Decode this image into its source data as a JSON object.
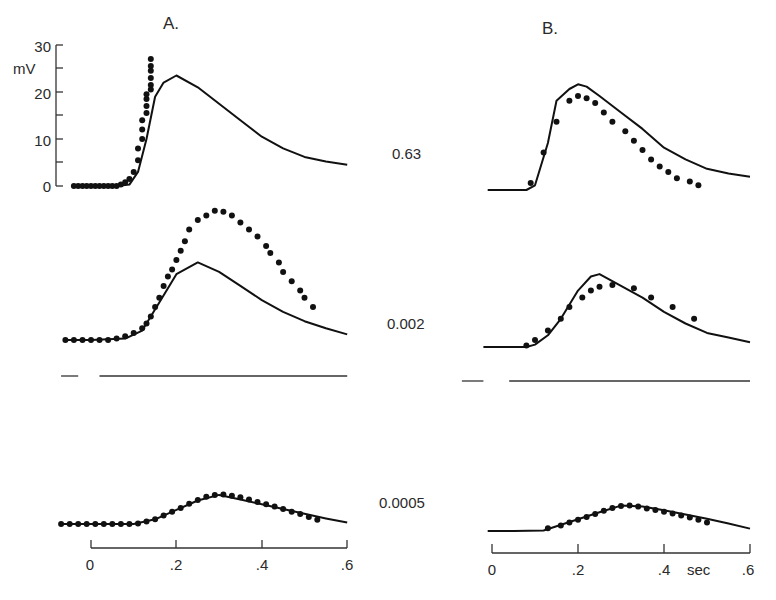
{
  "chart_data": {
    "type": "line",
    "title": "",
    "panels": [
      {
        "label": "A.",
        "xlabel": "sec",
        "ylabel": "mV",
        "xticks": [
          "0",
          ".2",
          ".4",
          ".6"
        ],
        "yticks": [
          "0",
          "10",
          "20",
          "30"
        ],
        "ylim": [
          0,
          30
        ],
        "xlim": [
          0,
          0.6
        ],
        "rows": [
          {
            "condition": "0.63",
            "solid_trace": {
              "x": [
                -0.04,
                0.0,
                0.06,
                0.09,
                0.11,
                0.13,
                0.15,
                0.17,
                0.2,
                0.25,
                0.3,
                0.35,
                0.4,
                0.45,
                0.5,
                0.55,
                0.6
              ],
              "y": [
                0,
                0,
                0,
                0.3,
                3,
                10,
                19,
                22,
                23.5,
                21,
                17.5,
                14,
                10.5,
                8,
                6.2,
                5.2,
                4.5
              ]
            },
            "dots": {
              "x": [
                -0.04,
                -0.03,
                -0.02,
                -0.01,
                0.0,
                0.01,
                0.02,
                0.03,
                0.04,
                0.05,
                0.06,
                0.07,
                0.08,
                0.09,
                0.1,
                0.11,
                0.11,
                0.12,
                0.12,
                0.12,
                0.13,
                0.13,
                0.13,
                0.13,
                0.14,
                0.14,
                0.14,
                0.14,
                0.14,
                0.14
              ],
              "y": [
                0,
                0,
                0,
                0,
                0,
                0,
                0,
                0,
                0,
                0,
                0,
                0.3,
                0.8,
                1.5,
                3,
                5.5,
                8,
                10,
                12,
                14,
                15.5,
                17,
                18.5,
                19.5,
                20.5,
                21.5,
                23,
                24.5,
                25.5,
                27
              ]
            }
          },
          {
            "condition": "0.002",
            "solid_trace": {
              "x": [
                -0.06,
                0.0,
                0.08,
                0.12,
                0.16,
                0.2,
                0.25,
                0.3,
                0.35,
                0.4,
                0.45,
                0.5,
                0.55,
                0.6
              ],
              "y": [
                0,
                0,
                0.3,
                2,
                8,
                14,
                16.5,
                14.5,
                11.5,
                8.5,
                6,
                4,
                2.5,
                1.2
              ]
            },
            "dots": {
              "x": [
                -0.06,
                -0.04,
                -0.02,
                0.0,
                0.02,
                0.04,
                0.06,
                0.08,
                0.1,
                0.12,
                0.13,
                0.14,
                0.15,
                0.16,
                0.17,
                0.18,
                0.19,
                0.2,
                0.21,
                0.22,
                0.23,
                0.25,
                0.27,
                0.29,
                0.31,
                0.33,
                0.35,
                0.37,
                0.39,
                0.41,
                0.42,
                0.44,
                0.45,
                0.47,
                0.49,
                0.5,
                0.52
              ],
              "y": [
                0,
                0,
                0,
                0,
                0,
                0,
                0.3,
                0.8,
                1.5,
                2.5,
                3.5,
                5,
                7,
                9,
                11.5,
                13.5,
                15,
                17,
                19,
                21,
                23.5,
                25.5,
                26.5,
                27.5,
                27.3,
                26.5,
                25,
                23.5,
                22,
                20,
                18.5,
                16.5,
                14.5,
                12.5,
                10.5,
                9,
                7
              ]
            }
          },
          {
            "condition": "0.0005",
            "solid_trace": {
              "x": [
                -0.07,
                0.0,
                0.1,
                0.15,
                0.2,
                0.25,
                0.3,
                0.35,
                0.4,
                0.45,
                0.5,
                0.55,
                0.6
              ],
              "y": [
                0,
                0,
                0,
                1,
                3,
                5,
                6.2,
                5.2,
                4.2,
                3.2,
                2.2,
                1.2,
                0.3
              ]
            },
            "dots": {
              "x": [
                -0.07,
                -0.05,
                -0.03,
                -0.01,
                0.01,
                0.03,
                0.05,
                0.07,
                0.09,
                0.11,
                0.13,
                0.15,
                0.17,
                0.19,
                0.21,
                0.23,
                0.25,
                0.27,
                0.29,
                0.31,
                0.33,
                0.35,
                0.37,
                0.39,
                0.41,
                0.43,
                0.45,
                0.47,
                0.49,
                0.51,
                0.53
              ],
              "y": [
                0,
                0,
                0,
                0,
                0,
                0,
                0,
                0,
                0,
                0.1,
                0.5,
                1,
                1.8,
                2.6,
                3.4,
                4.3,
                5.1,
                5.8,
                6.2,
                6.3,
                6,
                5.7,
                5.2,
                4.7,
                4.2,
                3.7,
                3.2,
                2.6,
                2.1,
                1.5,
                0.9
              ]
            }
          }
        ],
        "step_marker": {
          "segments": [
            [
              -0.07,
              -0.03
            ],
            [
              0.02,
              0.6
            ]
          ]
        }
      },
      {
        "label": "B.",
        "xlabel": "sec",
        "xticks": [
          "0",
          ".2",
          ".4",
          ".6"
        ],
        "xlim": [
          0,
          0.6
        ],
        "rows": [
          {
            "condition": "0.63",
            "solid_trace": {
              "x": [
                -0.01,
                0.0,
                0.04,
                0.08,
                0.1,
                0.13,
                0.15,
                0.18,
                0.2,
                0.22,
                0.25,
                0.3,
                0.35,
                0.4,
                0.45,
                0.5,
                0.55,
                0.6
              ],
              "y": [
                0,
                0,
                0,
                0,
                1,
                10,
                19,
                21.5,
                22.5,
                22,
                20,
                16.5,
                13,
                9,
                6.5,
                4.5,
                3.5,
                2.8
              ]
            },
            "dots": {
              "x": [
                0.09,
                0.12,
                0.15,
                0.18,
                0.2,
                0.22,
                0.24,
                0.26,
                0.28,
                0.31,
                0.33,
                0.35,
                0.37,
                0.39,
                0.41,
                0.43,
                0.46,
                0.48
              ],
              "y": [
                1.5,
                8,
                14.5,
                19,
                20,
                19.5,
                18.5,
                16.5,
                14.5,
                12.5,
                10.5,
                8.5,
                6.5,
                5,
                3.8,
                2.5,
                1.8,
                1
              ]
            }
          },
          {
            "condition": "0.002",
            "solid_trace": {
              "x": [
                -0.02,
                0.0,
                0.05,
                0.08,
                0.1,
                0.13,
                0.16,
                0.2,
                0.23,
                0.25,
                0.3,
                0.35,
                0.4,
                0.45,
                0.5,
                0.55,
                0.6
              ],
              "y": [
                0,
                0,
                0,
                0,
                0.5,
                2.5,
                6,
                12,
                15,
                15.5,
                13,
                10.5,
                7.5,
                5,
                3,
                2,
                1
              ]
            },
            "dots": {
              "x": [
                0.08,
                0.1,
                0.13,
                0.16,
                0.18,
                0.21,
                0.23,
                0.25,
                0.28,
                0.33,
                0.37,
                0.42,
                0.47
              ],
              "y": [
                0.3,
                1.5,
                3.5,
                6,
                8.5,
                10.5,
                12,
                12.8,
                13.2,
                12.5,
                10.5,
                8.5,
                6
              ]
            }
          },
          {
            "condition": "0.0005",
            "solid_trace": {
              "x": [
                -0.01,
                0.0,
                0.05,
                0.12,
                0.15,
                0.2,
                0.25,
                0.3,
                0.35,
                0.4,
                0.45,
                0.5,
                0.55,
                0.6
              ],
              "y": [
                0,
                0,
                0,
                0.1,
                1,
                2.5,
                4,
                5.4,
                5.2,
                4.4,
                3.5,
                2.6,
                1.6,
                0.5
              ]
            },
            "dots": {
              "x": [
                0.13,
                0.16,
                0.18,
                0.2,
                0.22,
                0.24,
                0.26,
                0.28,
                0.3,
                0.32,
                0.34,
                0.36,
                0.38,
                0.4,
                0.42,
                0.44,
                0.46,
                0.48,
                0.5
              ],
              "y": [
                0.6,
                1.2,
                1.8,
                2.4,
                3,
                3.6,
                4.3,
                4.9,
                5.3,
                5.4,
                5.2,
                4.8,
                4.5,
                4.1,
                3.7,
                3.3,
                2.9,
                2.4,
                1.8
              ]
            }
          }
        ],
        "step_marker": {
          "segments": [
            [
              -0.07,
              -0.02
            ],
            [
              0.04,
              0.6
            ]
          ]
        }
      }
    ],
    "legend": [],
    "annotations": [
      "A.",
      "B.",
      "0.63",
      "0.002",
      "0.0005",
      "mV",
      "sec"
    ],
    "grid": false,
    "legend_position": "none"
  },
  "labels": {
    "panel_a": "A.",
    "panel_b": "B.",
    "ylabel": "mV",
    "xlabel": "sec",
    "yticks": [
      "30",
      "20",
      "10",
      "0"
    ],
    "xticks": [
      "0",
      ".2",
      ".4",
      ".6"
    ],
    "conditions": [
      "0.63",
      "0.002",
      "0.0005"
    ]
  }
}
